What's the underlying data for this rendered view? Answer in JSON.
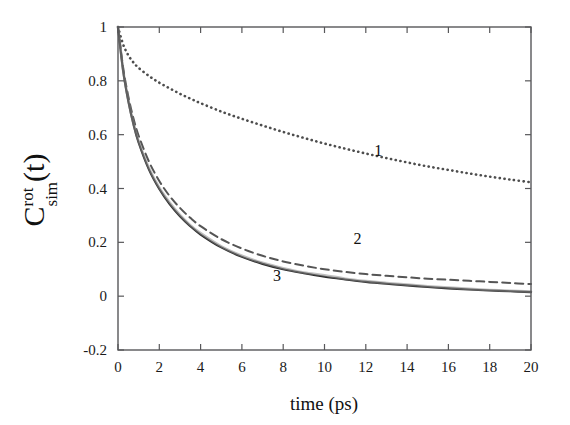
{
  "chart_data": {
    "type": "line",
    "title": "",
    "xlabel": "time (ps)",
    "ylabel": "C_sim^rot(t)",
    "ylabel_parts": {
      "base": "C",
      "superscript": "rot",
      "subscript": "sim",
      "suffix": "(t)"
    },
    "xlim": [
      0,
      20
    ],
    "ylim": [
      -0.2,
      1.0
    ],
    "xticks": [
      0,
      2,
      4,
      6,
      8,
      10,
      12,
      14,
      16,
      18,
      20
    ],
    "xtick_labels": [
      "0",
      "2",
      "4",
      "6",
      "8",
      "10",
      "12",
      "14",
      "16",
      "18",
      "20"
    ],
    "yticks": [
      1,
      0.8,
      0.6,
      0.4,
      0.2,
      0,
      -0.2
    ],
    "ytick_labels": [
      "1",
      "0.8",
      "0.6",
      "0.4",
      "0.2",
      "0",
      "-0.2"
    ],
    "grid": false,
    "legend_position": "inline-annotations",
    "annotations": [
      {
        "text": "1",
        "x": 12.6,
        "y": 0.52,
        "curve": "curve-1"
      },
      {
        "text": "2",
        "x": 11.6,
        "y": 0.195,
        "curve": "curve-2"
      },
      {
        "text": "3",
        "x": 7.7,
        "y": 0.055,
        "curve": "curve-3"
      }
    ],
    "series": [
      {
        "name": "1",
        "style": "dotted",
        "color": "#4d4d4d",
        "x": [
          0,
          0.25,
          0.5,
          0.75,
          1,
          1.5,
          2,
          2.5,
          3,
          3.5,
          4,
          5,
          6,
          7,
          8,
          9,
          10,
          11,
          12,
          13,
          14,
          15,
          16,
          17,
          18,
          19,
          20
        ],
        "y": [
          1.0,
          0.935,
          0.895,
          0.868,
          0.848,
          0.818,
          0.793,
          0.772,
          0.752,
          0.734,
          0.717,
          0.686,
          0.659,
          0.634,
          0.61,
          0.588,
          0.567,
          0.548,
          0.53,
          0.513,
          0.497,
          0.482,
          0.469,
          0.456,
          0.444,
          0.433,
          0.423
        ]
      },
      {
        "name": "2",
        "style": "dashed",
        "color": "#555555",
        "x": [
          0,
          0.25,
          0.5,
          0.75,
          1,
          1.5,
          2,
          2.5,
          3,
          3.5,
          4,
          5,
          6,
          7,
          8,
          9,
          10,
          11,
          12,
          13,
          14,
          15,
          16,
          17,
          18,
          19,
          20
        ],
        "y": [
          1.0,
          0.848,
          0.742,
          0.66,
          0.596,
          0.5,
          0.428,
          0.372,
          0.328,
          0.291,
          0.26,
          0.212,
          0.177,
          0.15,
          0.129,
          0.113,
          0.1,
          0.09,
          0.082,
          0.076,
          0.07,
          0.065,
          0.061,
          0.057,
          0.053,
          0.049,
          0.045
        ]
      },
      {
        "name": "3",
        "style": "solid",
        "color": "#2b2b2b",
        "x": [
          0,
          0.25,
          0.5,
          0.75,
          1,
          1.5,
          2,
          2.5,
          3,
          3.5,
          4,
          5,
          6,
          7,
          8,
          9,
          10,
          11,
          12,
          13,
          14,
          15,
          16,
          17,
          18,
          19,
          20
        ],
        "y": [
          1.0,
          0.836,
          0.724,
          0.638,
          0.57,
          0.47,
          0.398,
          0.342,
          0.297,
          0.26,
          0.229,
          0.181,
          0.146,
          0.12,
          0.1,
          0.085,
          0.072,
          0.062,
          0.053,
          0.046,
          0.04,
          0.034,
          0.029,
          0.025,
          0.021,
          0.018,
          0.015
        ]
      },
      {
        "name": "3-noise",
        "style": "noisy-overlay",
        "color": "#8c8c8c",
        "x": [
          0,
          0.25,
          0.5,
          0.75,
          1,
          1.5,
          2,
          2.5,
          3,
          3.5,
          4,
          5,
          6,
          7,
          8,
          9,
          10,
          11,
          12,
          13,
          14,
          15,
          16,
          17,
          18,
          19,
          20
        ],
        "y": [
          1.0,
          0.84,
          0.73,
          0.642,
          0.576,
          0.476,
          0.403,
          0.348,
          0.302,
          0.264,
          0.234,
          0.185,
          0.15,
          0.124,
          0.104,
          0.088,
          0.078,
          0.065,
          0.056,
          0.049,
          0.043,
          0.037,
          0.032,
          0.027,
          0.023,
          0.02,
          0.017
        ]
      }
    ]
  }
}
